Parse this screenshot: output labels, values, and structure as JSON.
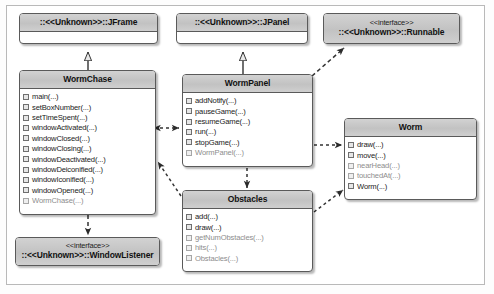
{
  "diagram": {
    "title_visible": false,
    "colors": {
      "box_border": "#5a5a5a",
      "title_fill": "#c8c8c8",
      "body_fill": "#ffffff",
      "frame_border": "#b9b9b9",
      "connector": "#333333",
      "member_text": "#1a1a1a",
      "member_text_inherited": "#8d8d8d"
    },
    "classes": [
      {
        "id": "jframe",
        "name": "::<<Unknown>>::JFrame",
        "stereotype": "",
        "members": [],
        "x": 19,
        "y": 13,
        "w": 139,
        "h": 31
      },
      {
        "id": "jpanel",
        "name": "::<<Unknown>>::JPanel",
        "stereotype": "",
        "members": [],
        "x": 176,
        "y": 13,
        "w": 132,
        "h": 31
      },
      {
        "id": "runnable",
        "name": "::<<Unknown>>::Runnable",
        "stereotype": "<<interface>>",
        "members": [],
        "x": 323,
        "y": 13,
        "w": 137,
        "h": 31
      },
      {
        "id": "wormchase",
        "name": "WormChase",
        "stereotype": "",
        "members": [
          {
            "label": "main(...)",
            "inherited": false
          },
          {
            "label": "setBoxNumber(...)",
            "inherited": false
          },
          {
            "label": "setTimeSpent(...)",
            "inherited": false
          },
          {
            "label": "windowActivated(...)",
            "inherited": false
          },
          {
            "label": "windowClosed(...)",
            "inherited": false
          },
          {
            "label": "windowClosing(...)",
            "inherited": false
          },
          {
            "label": "windowDeactivated(...)",
            "inherited": false
          },
          {
            "label": "windowDeiconified(...)",
            "inherited": false
          },
          {
            "label": "windowIconified(...)",
            "inherited": false
          },
          {
            "label": "windowOpened(...)",
            "inherited": false
          },
          {
            "label": "WormChase(...)",
            "inherited": true
          }
        ],
        "x": 19,
        "y": 70,
        "w": 137,
        "h": 145
      },
      {
        "id": "wormpanel",
        "name": "WormPanel",
        "stereotype": "",
        "members": [
          {
            "label": "addNotify(...)",
            "inherited": false
          },
          {
            "label": "pauseGame(...)",
            "inherited": false
          },
          {
            "label": "resumeGame(...)",
            "inherited": false
          },
          {
            "label": "run(...)",
            "inherited": false
          },
          {
            "label": "stopGame(...)",
            "inherited": false
          },
          {
            "label": "WormPanel(...)",
            "inherited": true
          }
        ],
        "x": 182,
        "y": 74,
        "w": 131,
        "h": 93
      },
      {
        "id": "worm",
        "name": "Worm",
        "stereotype": "",
        "members": [
          {
            "label": "draw(...)",
            "inherited": false
          },
          {
            "label": "move(...)",
            "inherited": false
          },
          {
            "label": "nearHead(...)",
            "inherited": true
          },
          {
            "label": "touchedAt(...)",
            "inherited": true
          },
          {
            "label": "Worm(...)",
            "inherited": false
          }
        ],
        "x": 344,
        "y": 118,
        "w": 133,
        "h": 82
      },
      {
        "id": "obstacles",
        "name": "Obstacles",
        "stereotype": "",
        "members": [
          {
            "label": "add(...)",
            "inherited": false
          },
          {
            "label": "draw(...)",
            "inherited": false
          },
          {
            "label": "getNumObstacles(...)",
            "inherited": true
          },
          {
            "label": "hits(...)",
            "inherited": true
          },
          {
            "label": "Obstacles(...)",
            "inherited": true
          }
        ],
        "x": 182,
        "y": 190,
        "w": 131,
        "h": 82
      },
      {
        "id": "windowlistener",
        "name": "::<<Unknown>>::WindowListener",
        "stereotype": "<<interface>>",
        "members": [],
        "x": 15,
        "y": 237,
        "w": 145,
        "h": 29
      }
    ],
    "relations": [
      {
        "from": "wormchase",
        "to": "jframe",
        "type": "generalization",
        "style": "solid"
      },
      {
        "from": "wormpanel",
        "to": "jpanel",
        "type": "generalization",
        "style": "solid"
      },
      {
        "from": "wormpanel",
        "to": "runnable",
        "type": "realization",
        "style": "dashed"
      },
      {
        "from": "wormchase",
        "to": "windowlistener",
        "type": "realization",
        "style": "dashed"
      },
      {
        "from": "wormchase",
        "to": "wormpanel",
        "type": "association",
        "style": "dashed-bidirectional"
      },
      {
        "from": "wormpanel",
        "to": "worm",
        "type": "dependency",
        "style": "dashed"
      },
      {
        "from": "wormpanel",
        "to": "obstacles",
        "type": "dependency",
        "style": "dashed"
      },
      {
        "from": "obstacles",
        "to": "worm",
        "type": "dependency",
        "style": "dashed"
      },
      {
        "from": "obstacles",
        "to": "wormchase",
        "type": "dependency",
        "style": "dashed"
      }
    ]
  }
}
